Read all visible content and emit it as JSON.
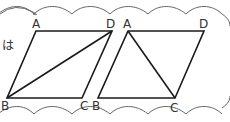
{
  "side_text": "は",
  "figures": [
    {
      "name": "left-parallelogram",
      "labels": {
        "A": "A",
        "B": "B",
        "C": "C",
        "D": "D"
      },
      "diagonal": "BD"
    },
    {
      "name": "right-parallelogram",
      "labels": {
        "A": "A",
        "B": "B",
        "C": "C",
        "D": "D"
      },
      "diagonal": "AC"
    }
  ],
  "colors": {
    "line": "#1a1a1a",
    "border": "#666666",
    "text": "#333333"
  }
}
